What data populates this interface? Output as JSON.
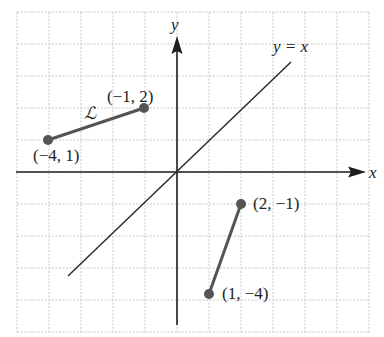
{
  "diagram": {
    "axes": {
      "x_label": "x",
      "y_label": "y"
    },
    "grid": {
      "x_min": -5,
      "x_max": 6,
      "y_min": -5,
      "y_max": 5,
      "unit_px": 32,
      "origin_px": [
        177,
        172
      ]
    },
    "line_y_equals_x": {
      "label": "y = x",
      "from": [
        -3.5,
        -3.2
      ],
      "to": [
        3.8,
        3.8
      ]
    },
    "segments": [
      {
        "name": "L",
        "label": "ℒ",
        "points": [
          {
            "x": -4,
            "y": 1,
            "label": "(−4, 1)"
          },
          {
            "x": -1,
            "y": 2,
            "label": "(−1, 2)"
          }
        ]
      },
      {
        "name": "reflected",
        "label": "",
        "points": [
          {
            "x": 2,
            "y": -1,
            "label": "(2, −1)"
          },
          {
            "x": 1,
            "y": -4,
            "label": "(1, −4)"
          }
        ]
      }
    ]
  },
  "chart_data": {
    "type": "scatter",
    "title": "",
    "xlabel": "x",
    "ylabel": "y",
    "xlim": [
      -5,
      6
    ],
    "ylim": [
      -5,
      5
    ],
    "grid": true,
    "series": [
      {
        "name": "ℒ",
        "points": [
          [
            -4,
            1
          ],
          [
            -1,
            2
          ]
        ],
        "style": "segment"
      },
      {
        "name": "reflection of ℒ",
        "points": [
          [
            2,
            -1
          ],
          [
            1,
            -4
          ]
        ],
        "style": "segment"
      },
      {
        "name": "y = x",
        "points": [
          [
            -3.5,
            -3.5
          ],
          [
            3.8,
            3.8
          ]
        ],
        "style": "line"
      }
    ],
    "annotations": [
      "(−1, 2)",
      "(−4, 1)",
      "ℒ",
      "(2, −1)",
      "(1, −4)",
      "y = x"
    ]
  }
}
